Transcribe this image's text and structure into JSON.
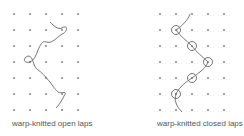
{
  "panels": [
    {
      "id": "open",
      "caption": "warp-knitted open laps",
      "grid": {
        "columns": 5,
        "rows": 7
      },
      "lap_type": "open"
    },
    {
      "id": "closed",
      "caption": "warp-knitted closed laps",
      "grid": {
        "columns": 5,
        "rows": 7
      },
      "lap_type": "closed"
    }
  ],
  "colors": {
    "dot": "#777777",
    "line": "#666666",
    "text": "#555555"
  }
}
